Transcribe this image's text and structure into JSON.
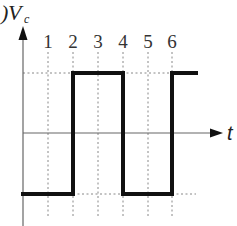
{
  "diagram": {
    "type": "square-wave-timing-diagram",
    "y_axis_label": "V",
    "y_axis_subscript": "c",
    "y_axis_prefix": ")",
    "x_axis_label": "t",
    "tick_labels": [
      "1",
      "2",
      "3",
      "4",
      "5",
      "6"
    ],
    "signal_levels": {
      "high": "positive",
      "low": "negative"
    },
    "signal_sequence": [
      {
        "from": "start",
        "to": "2",
        "level": "low"
      },
      {
        "from": "2",
        "to": "4",
        "level": "high"
      },
      {
        "from": "4",
        "to": "6",
        "level": "low"
      },
      {
        "from": "6",
        "to": "end",
        "level": "high"
      }
    ],
    "colors": {
      "signal": "#111111",
      "axis": "#555555",
      "guides": "#888888",
      "background": "#ffffff"
    }
  }
}
